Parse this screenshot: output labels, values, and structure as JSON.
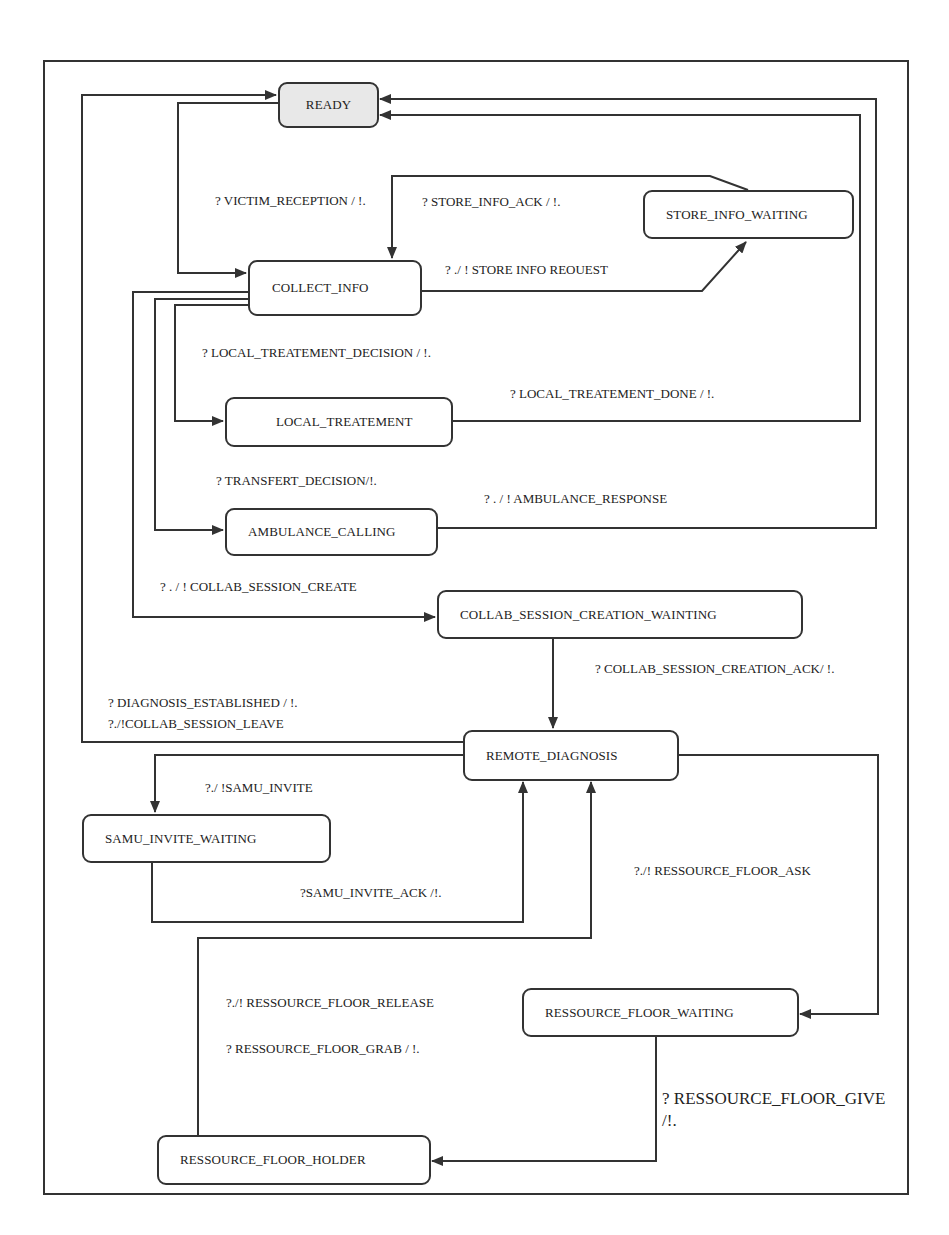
{
  "diagram": {
    "type": "state-machine",
    "states": [
      {
        "id": "ready",
        "name": "READY",
        "initial": true
      },
      {
        "id": "collect_info",
        "name": "COLLECT_INFO"
      },
      {
        "id": "store_info_waiting",
        "name": "STORE_INFO_WAITING"
      },
      {
        "id": "local_treatement",
        "name": "LOCAL_TREATEMENT"
      },
      {
        "id": "ambulance_calling",
        "name": "AMBULANCE_CALLING"
      },
      {
        "id": "collab_session_creation_wainting",
        "name": "COLLAB_SESSION_CREATION_WAINTING"
      },
      {
        "id": "remote_diagnosis",
        "name": "REMOTE_DIAGNOSIS"
      },
      {
        "id": "samu_invite_waiting",
        "name": "SAMU_INVITE_WAITING"
      },
      {
        "id": "ressource_floor_waiting",
        "name": "RESSOURCE_FLOOR_WAITING"
      },
      {
        "id": "ressource_floor_holder",
        "name": "RESSOURCE_FLOOR_HOLDER"
      }
    ],
    "transitions": [
      {
        "from": "READY",
        "to": "COLLECT_INFO",
        "label": "? VICTIM_RECEPTION / !."
      },
      {
        "from": "STORE_INFO_WAITING",
        "to": "COLLECT_INFO",
        "label": "? STORE_INFO_ACK / !."
      },
      {
        "from": "COLLECT_INFO",
        "to": "STORE_INFO_WAITING",
        "label": "? ./ ! STORE  INFO  REOUEST"
      },
      {
        "from": "COLLECT_INFO",
        "to": "LOCAL_TREATEMENT",
        "label": "? LOCAL_TREATEMENT_DECISION / !."
      },
      {
        "from": "LOCAL_TREATEMENT",
        "to": "READY",
        "label": "? LOCAL_TREATEMENT_DONE / !."
      },
      {
        "from": "COLLECT_INFO",
        "to": "AMBULANCE_CALLING",
        "label": "? TRANSFERT_DECISION/!."
      },
      {
        "from": "AMBULANCE_CALLING",
        "to": "READY",
        "label": "? . / ! AMBULANCE_RESPONSE"
      },
      {
        "from": "COLLECT_INFO",
        "to": "COLLAB_SESSION_CREATION_WAINTING",
        "label": "? . / ! COLLAB_SESSION_CREATE"
      },
      {
        "from": "COLLAB_SESSION_CREATION_WAINTING",
        "to": "REMOTE_DIAGNOSIS",
        "label": "? COLLAB_SESSION_CREATION_ACK/ !."
      },
      {
        "from": "REMOTE_DIAGNOSIS",
        "to": "READY",
        "label": "? DIAGNOSIS_ESTABLISHED / !.",
        "label2": "?./!COLLAB_SESSION_LEAVE"
      },
      {
        "from": "REMOTE_DIAGNOSIS",
        "to": "SAMU_INVITE_WAITING",
        "label": "?./ !SAMU_INVITE"
      },
      {
        "from": "SAMU_INVITE_WAITING",
        "to": "REMOTE_DIAGNOSIS",
        "label": "?SAMU_INVITE_ACK /!."
      },
      {
        "from": "REMOTE_DIAGNOSIS",
        "to": "RESSOURCE_FLOOR_WAITING",
        "label": "?./! RESSOURCE_FLOOR_ASK"
      },
      {
        "from": "RESSOURCE_FLOOR_HOLDER",
        "to": "REMOTE_DIAGNOSIS",
        "label": "?./! RESSOURCE_FLOOR_RELEASE",
        "label2": "? RESSOURCE_FLOOR_GRAB / !."
      },
      {
        "from": "RESSOURCE_FLOOR_WAITING",
        "to": "RESSOURCE_FLOOR_HOLDER",
        "label": "? RESSOURCE_FLOOR_GIVE /!."
      }
    ]
  },
  "colors": {
    "line": "#333333",
    "initial_fill": "#e8e8e8",
    "state_fill": "#ffffff",
    "text": "#222222"
  }
}
